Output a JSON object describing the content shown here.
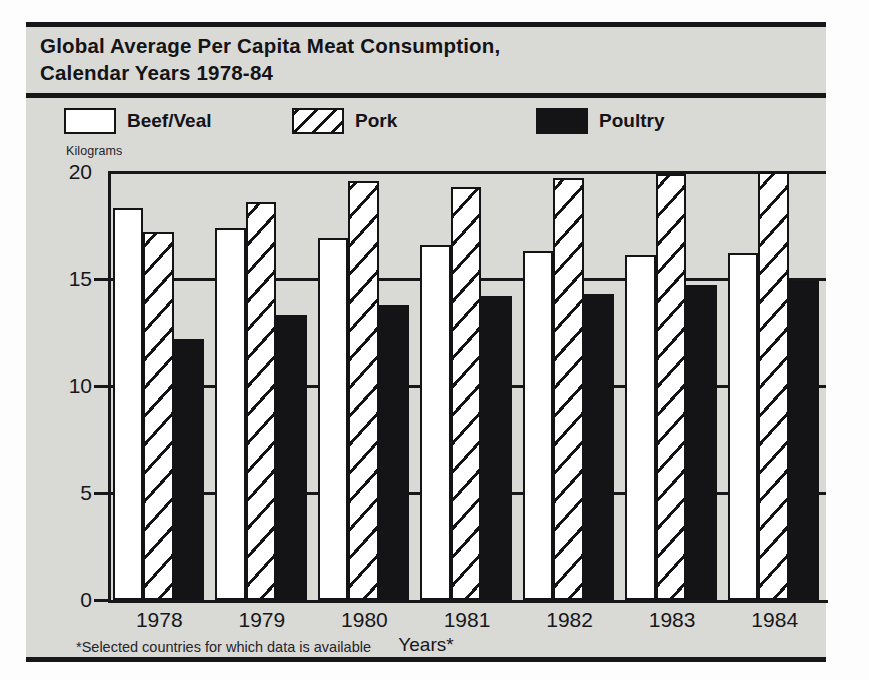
{
  "chart": {
    "title_line1": "Global Average Per Capita Meat Consumption,",
    "title_line2": "Calendar Years 1978-84",
    "units_label": "Kilograms",
    "xaxis_title": "Years*",
    "footnote": "*Selected countries for which data is available"
  },
  "legend": {
    "items": [
      {
        "label": "Beef/Veal",
        "fill": "white",
        "color": "#ffffff"
      },
      {
        "label": "Pork",
        "fill": "hatch",
        "color": "#ffffff"
      },
      {
        "label": "Poultry",
        "fill": "solid",
        "color": "#141417"
      }
    ]
  },
  "colors": {
    "panel_background": "#d9d9d6",
    "ink": "#141417",
    "page_background": "#fdfdfd"
  },
  "chart_data": {
    "type": "bar",
    "title": "Global Average Per Capita Meat Consumption, Calendar Years 1978-84",
    "subtitle": "",
    "xlabel": "Years*",
    "ylabel": "Kilograms",
    "categories": [
      "1978",
      "1979",
      "1980",
      "1981",
      "1982",
      "1983",
      "1984"
    ],
    "series": [
      {
        "name": "Beef/Veal",
        "values": [
          18.3,
          17.4,
          16.9,
          16.6,
          16.3,
          16.1,
          16.2
        ]
      },
      {
        "name": "Pork",
        "values": [
          17.2,
          18.6,
          19.6,
          19.3,
          19.7,
          19.9,
          20.0
        ]
      },
      {
        "name": "Poultry",
        "values": [
          12.2,
          13.3,
          13.8,
          14.2,
          14.3,
          14.7,
          14.9
        ]
      }
    ],
    "ylim": [
      0,
      20
    ],
    "yticks": [
      0,
      5,
      10,
      15,
      20
    ],
    "ytick_labels": [
      "0",
      "5",
      "10",
      "15",
      "20"
    ],
    "grid": true,
    "legend_position": "top",
    "annotations": [
      "*Selected countries for which data is available"
    ]
  }
}
